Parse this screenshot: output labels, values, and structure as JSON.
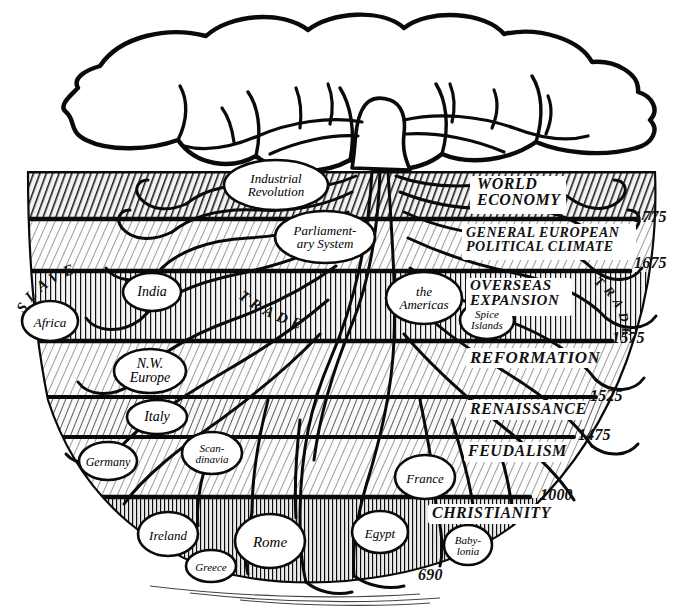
{
  "diagram": {
    "ink_color": "#111111",
    "paper_color": "#ffffff"
  },
  "canopy": {
    "name": "tree-canopy",
    "label": ""
  },
  "strata": [
    {
      "id": "world-economy",
      "label": "WORLD ECONOMY",
      "lines": [
        "WORLD",
        "ECONOMY"
      ],
      "tone": "dark-hatch",
      "date_below": "1775"
    },
    {
      "id": "general-european",
      "label": "GENERAL EUROPEAN POLITICAL CLIMATE",
      "lines": [
        "GENERAL EUROPEAN",
        "POLITICAL CLIMATE"
      ],
      "tone": "light-hatch",
      "date_below": "1675"
    },
    {
      "id": "overseas-expansion",
      "label": "OVERSEAS EXPANSION",
      "lines": [
        "OVERSEAS",
        "EXPANSION"
      ],
      "tone": "vertical-hatch",
      "date_below": "1575"
    },
    {
      "id": "reformation",
      "label": "REFORMATION",
      "lines": [
        "REFORMATION"
      ],
      "tone": "light-hatch",
      "date_below": "1525"
    },
    {
      "id": "renaissance",
      "label": "RENAISSANCE",
      "lines": [
        "RENAISSANCE"
      ],
      "tone": "mid-hatch",
      "date_below": "1475"
    },
    {
      "id": "feudalism",
      "label": "FEUDALISM",
      "lines": [
        "FEUDALISM"
      ],
      "tone": "light-hatch",
      "date_below": "1000"
    },
    {
      "id": "christianity",
      "label": "CHRISTIANITY",
      "lines": [
        "CHRISTIANITY"
      ],
      "tone": "dark-vert",
      "date_below": "690"
    }
  ],
  "dates": [
    "1775",
    "1675",
    "1575",
    "1525",
    "1475",
    "1000",
    "690"
  ],
  "nodes": [
    {
      "id": "industrial-revolution",
      "lines": [
        "Industrial",
        "Revolution"
      ],
      "font_size": 13
    },
    {
      "id": "parliamentary-system",
      "lines": [
        "Parliament-",
        "ary System"
      ],
      "font_size": 13
    },
    {
      "id": "the-americas",
      "lines": [
        "the",
        "Americas"
      ],
      "font_size": 13
    },
    {
      "id": "spice-islands",
      "lines": [
        "Spice",
        "Islands"
      ],
      "font_size": 11
    },
    {
      "id": "india",
      "lines": [
        "India"
      ],
      "font_size": 14
    },
    {
      "id": "africa",
      "lines": [
        "Africa"
      ],
      "font_size": 13
    },
    {
      "id": "nw-europe",
      "lines": [
        "N.W.",
        "Europe"
      ],
      "font_size": 14
    },
    {
      "id": "italy",
      "lines": [
        "Italy"
      ],
      "font_size": 14
    },
    {
      "id": "germany",
      "lines": [
        "Germany"
      ],
      "font_size": 12
    },
    {
      "id": "scandinavia",
      "lines": [
        "Scan-",
        "dinavia"
      ],
      "font_size": 11
    },
    {
      "id": "france",
      "lines": [
        "France"
      ],
      "font_size": 13
    },
    {
      "id": "ireland",
      "lines": [
        "Ireland"
      ],
      "font_size": 13
    },
    {
      "id": "rome",
      "lines": [
        "Rome"
      ],
      "font_size": 15
    },
    {
      "id": "greece",
      "lines": [
        "Greece"
      ],
      "font_size": 11
    },
    {
      "id": "egypt",
      "lines": [
        "Egypt"
      ],
      "font_size": 13
    },
    {
      "id": "babylonia",
      "lines": [
        "Baby-",
        "lonia"
      ],
      "font_size": 11
    }
  ],
  "curved_text": [
    {
      "id": "slave-trade",
      "text": "SLAVE TRADE",
      "location": "left, overseas-expansion stratum"
    },
    {
      "id": "trade",
      "text": "TRADE",
      "location": "right, overseas-expansion stratum"
    }
  ],
  "node_labels": {
    "industrial_revolution_1": "Industrial",
    "industrial_revolution_2": "Revolution",
    "parliamentary_1": "Parliament-",
    "parliamentary_2": "ary System",
    "americas_1": "the",
    "americas_2": "Americas",
    "spice_1": "Spice",
    "spice_2": "Islands",
    "india": "India",
    "africa": "Africa",
    "nw_europe_1": "N.W.",
    "nw_europe_2": "Europe",
    "italy": "Italy",
    "germany": "Germany",
    "scandinavia_1": "Scan-",
    "scandinavia_2": "dinavia",
    "france": "France",
    "ireland": "Ireland",
    "rome": "Rome",
    "greece": "Greece",
    "egypt": "Egypt",
    "babylonia_1": "Baby-",
    "babylonia_2": "lonia"
  },
  "era_labels": {
    "world_economy_1": "WORLD",
    "world_economy_2": "ECONOMY",
    "general_european_1": "GENERAL EUROPEAN",
    "general_european_2": "POLITICAL CLIMATE",
    "overseas_1": "OVERSEAS",
    "overseas_2": "EXPANSION",
    "reformation": "REFORMATION",
    "renaissance": "RENAISSANCE",
    "feudalism": "FEUDALISM",
    "christianity": "CHRISTIANITY"
  },
  "date_labels": {
    "d1775": "1775",
    "d1675": "1675",
    "d1575": "1575",
    "d1525": "1525",
    "d1475": "1475",
    "d1000": "1000",
    "d690": "690"
  },
  "curved_labels": {
    "slave": "SLAVE",
    "trade_left": "TRADE",
    "trade_right": "TRADE"
  }
}
